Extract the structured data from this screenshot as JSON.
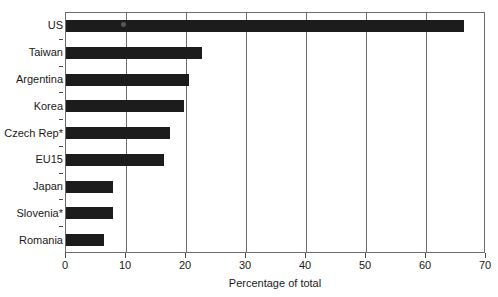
{
  "chart_data": {
    "type": "bar",
    "orientation": "horizontal",
    "title": "",
    "subtitle": "",
    "xlabel": "Percentage of total",
    "ylabel": "",
    "xlim": [
      0,
      70
    ],
    "xticks": [
      0,
      10,
      20,
      30,
      40,
      50,
      60,
      70
    ],
    "xticklabels": [
      "0",
      "10",
      "20",
      "30",
      "40",
      "50",
      "60",
      "70"
    ],
    "grid": "vertical",
    "legend": null,
    "bar_color": "#1c1c1c",
    "categories": [
      "US",
      "Taiwan",
      "Argentina",
      "Korea",
      "Czech Rep*",
      "EU15",
      "Japan",
      "Slovenia*",
      "Romania"
    ],
    "values": [
      66.4,
      22.7,
      20.5,
      19.7,
      17.3,
      16.4,
      7.9,
      7.8,
      6.4
    ],
    "series": [
      {
        "name": "Percentage of total",
        "values": [
          66.4,
          22.7,
          20.5,
          19.7,
          17.3,
          16.4,
          7.9,
          7.8,
          6.4
        ]
      }
    ],
    "annotations": [
      "* footnote marker on Czech Rep and Slovenia"
    ]
  }
}
